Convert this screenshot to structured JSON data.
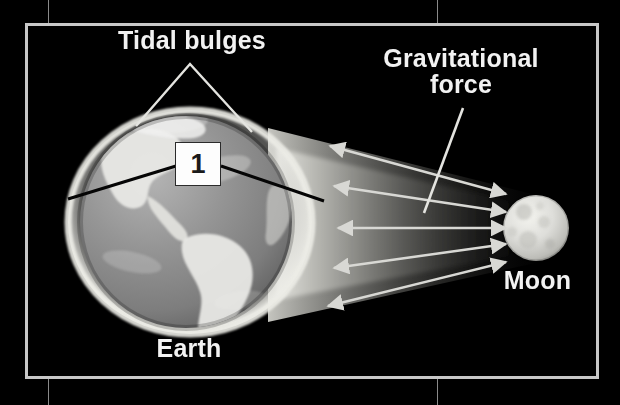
{
  "diagram": {
    "background_color": "#000000",
    "frame": {
      "color": "#c8c8c8",
      "x": 26,
      "y": 24,
      "width": 572,
      "height": 354
    },
    "labels": {
      "tidal_bulges": "Tidal bulges",
      "gravitational_force": "Gravitational\nforce",
      "earth": "Earth",
      "moon": "Moon"
    },
    "callout": {
      "number": "1",
      "box_fill": "#fdfdfd",
      "box_border": "#2b2b2b",
      "leader_color": "#000000"
    },
    "bodies": {
      "earth": {
        "name": "Earth",
        "center_x": 186,
        "center_y": 222,
        "radius": 108,
        "surface_color": "#8c8c8c",
        "landmass_color": "#e6e6e6",
        "bulge_color": "#d8d8d4",
        "features": "South America and North America visible"
      },
      "moon": {
        "name": "Moon",
        "center_x": 536,
        "center_y": 228,
        "radius": 33,
        "surface_color": "#d9d9d5",
        "features": "cratered grey sphere"
      }
    },
    "force_arrows": {
      "count": 5,
      "style": "double-headed",
      "color": "#d8d8d4",
      "description": "Gravitational force arrows fanning between the Moon and Earth's near-side tidal bulge"
    },
    "text_color": "#f2f2f2",
    "crop_mark_color": "#888888"
  }
}
